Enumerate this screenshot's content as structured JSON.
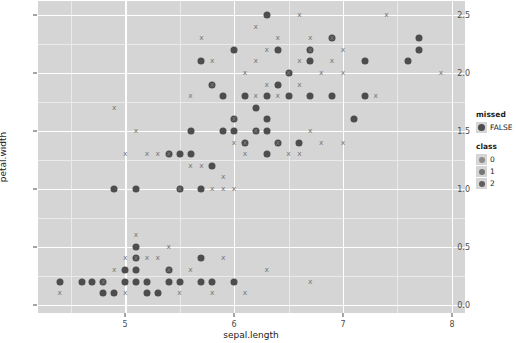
{
  "chart_data": {
    "type": "scatter",
    "title": "",
    "xlabel": "sepal.length",
    "ylabel": "petal.width",
    "xlim": [
      4.2,
      8.12
    ],
    "ylim": [
      -0.07,
      2.62
    ],
    "xticks": [
      5,
      6,
      7,
      8
    ],
    "xticklabels": [
      "5",
      "6",
      "7",
      "8"
    ],
    "yticks": [
      0.0,
      0.5,
      1.0,
      1.5,
      2.0,
      2.5
    ],
    "yticklabels": [
      "0.0",
      "0.5",
      "1.0",
      "1.5",
      "2.0",
      "2.5"
    ],
    "grid": true,
    "grid_major_color": "#ffffff",
    "grid_minor_color": "#eaeaea",
    "panel_color": "#d5d5d5",
    "legend_position": "right",
    "legends": [
      {
        "title": "missed",
        "entries": [
          {
            "label": "FALSE",
            "marker": "circle",
            "color": "#4d4d4d"
          }
        ]
      },
      {
        "title": "class",
        "entries": [
          {
            "label": "0",
            "marker": "circle",
            "color": "#8c8c8c"
          },
          {
            "label": "1",
            "marker": "circle",
            "color": "#767676"
          },
          {
            "label": "2",
            "marker": "circle",
            "color": "#5e5e5e"
          }
        ]
      }
    ],
    "series": [
      {
        "name": "missed-FALSE",
        "marker": "circle",
        "color": "#4d4d4d",
        "size": 7,
        "points": [
          [
            4.9,
            1.0
          ],
          [
            5.1,
            1.0
          ],
          [
            5.4,
            1.3
          ],
          [
            5.6,
            1.3
          ],
          [
            5.5,
            1.3
          ],
          [
            5.5,
            1.0
          ],
          [
            5.7,
            1.0
          ],
          [
            5.8,
            1.2
          ],
          [
            5.6,
            1.5
          ],
          [
            5.9,
            1.5
          ],
          [
            6.0,
            1.5
          ],
          [
            6.3,
            1.5
          ],
          [
            6.4,
            1.4
          ],
          [
            6.1,
            1.4
          ],
          [
            6.2,
            1.5
          ],
          [
            6.3,
            1.6
          ],
          [
            6.6,
            1.4
          ],
          [
            6.0,
            1.6
          ],
          [
            6.3,
            1.3
          ],
          [
            5.9,
            1.8
          ],
          [
            6.1,
            1.8
          ],
          [
            6.3,
            1.8
          ],
          [
            6.5,
            1.8
          ],
          [
            6.7,
            1.8
          ],
          [
            6.9,
            1.8
          ],
          [
            7.2,
            1.8
          ],
          [
            6.4,
            1.9
          ],
          [
            6.5,
            2.0
          ],
          [
            6.7,
            2.1
          ],
          [
            7.2,
            2.1
          ],
          [
            6.3,
            2.5
          ],
          [
            6.7,
            2.2
          ],
          [
            6.9,
            2.3
          ],
          [
            7.7,
            2.3
          ],
          [
            7.7,
            2.2
          ],
          [
            7.6,
            2.1
          ],
          [
            6.0,
            2.2
          ],
          [
            7.1,
            1.6
          ],
          [
            5.8,
            1.9
          ],
          [
            6.2,
            1.7
          ],
          [
            5.7,
            2.1
          ],
          [
            6.4,
            2.2
          ],
          [
            4.6,
            0.2
          ],
          [
            4.8,
            0.2
          ],
          [
            5.0,
            0.2
          ],
          [
            5.1,
            0.2
          ],
          [
            5.2,
            0.2
          ],
          [
            5.4,
            0.2
          ],
          [
            5.5,
            0.2
          ],
          [
            5.7,
            0.2
          ],
          [
            5.8,
            0.2
          ],
          [
            5.0,
            0.3
          ],
          [
            5.4,
            0.3
          ],
          [
            5.7,
            0.4
          ],
          [
            5.1,
            0.4
          ],
          [
            5.1,
            0.3
          ],
          [
            5.2,
            0.1
          ],
          [
            5.3,
            0.1
          ],
          [
            4.9,
            0.1
          ],
          [
            4.8,
            0.1
          ],
          [
            6.0,
            0.2
          ],
          [
            5.1,
            0.5
          ],
          [
            4.4,
            0.2
          ],
          [
            4.7,
            0.2
          ]
        ]
      },
      {
        "name": "missed-TRUE",
        "marker": "x",
        "color": "#7b7b7b",
        "size": 7,
        "points": [
          [
            4.9,
            1.7
          ],
          [
            5.1,
            1.5
          ],
          [
            5.2,
            1.3
          ],
          [
            5.3,
            1.3
          ],
          [
            5.0,
            1.3
          ],
          [
            5.4,
            1.3
          ],
          [
            5.6,
            1.2
          ],
          [
            5.7,
            1.2
          ],
          [
            5.8,
            1.0
          ],
          [
            6.0,
            1.0
          ],
          [
            5.5,
            1.0
          ],
          [
            5.9,
            1.0
          ],
          [
            5.9,
            1.1
          ],
          [
            6.2,
            1.5
          ],
          [
            6.0,
            1.4
          ],
          [
            6.1,
            1.4
          ],
          [
            6.4,
            1.4
          ],
          [
            6.1,
            1.3
          ],
          [
            6.5,
            1.3
          ],
          [
            6.6,
            1.3
          ],
          [
            6.0,
            1.6
          ],
          [
            6.7,
            1.5
          ],
          [
            5.6,
            1.8
          ],
          [
            6.2,
            1.8
          ],
          [
            6.4,
            1.8
          ],
          [
            5.8,
            1.9
          ],
          [
            6.3,
            1.9
          ],
          [
            6.6,
            1.9
          ],
          [
            6.1,
            2.0
          ],
          [
            6.5,
            2.0
          ],
          [
            6.8,
            2.0
          ],
          [
            7.0,
            2.0
          ],
          [
            5.8,
            2.1
          ],
          [
            6.2,
            2.1
          ],
          [
            6.6,
            2.1
          ],
          [
            6.9,
            2.1
          ],
          [
            5.7,
            2.3
          ],
          [
            6.4,
            2.3
          ],
          [
            6.7,
            2.3
          ],
          [
            6.9,
            2.3
          ],
          [
            6.2,
            2.4
          ],
          [
            6.6,
            2.5
          ],
          [
            7.4,
            2.5
          ],
          [
            6.3,
            2.2
          ],
          [
            6.7,
            2.2
          ],
          [
            7.0,
            2.2
          ],
          [
            7.9,
            2.0
          ],
          [
            7.3,
            1.8
          ],
          [
            6.8,
            1.4
          ],
          [
            7.0,
            1.4
          ],
          [
            4.4,
            0.1
          ],
          [
            5.0,
            0.4
          ],
          [
            5.1,
            0.4
          ],
          [
            4.9,
            0.3
          ],
          [
            5.4,
            0.3
          ],
          [
            5.6,
            0.3
          ],
          [
            5.1,
            0.6
          ],
          [
            5.2,
            0.4
          ],
          [
            5.3,
            0.4
          ],
          [
            5.8,
            0.1
          ],
          [
            6.1,
            0.1
          ],
          [
            5.5,
            0.1
          ],
          [
            5.4,
            0.5
          ],
          [
            6.3,
            0.3
          ],
          [
            6.7,
            0.2
          ],
          [
            4.8,
            0.2
          ],
          [
            5.9,
            0.4
          ],
          [
            5.0,
            0.1
          ]
        ]
      }
    ]
  }
}
